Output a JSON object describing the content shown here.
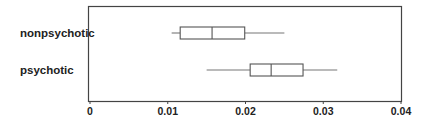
{
  "chart_data": {
    "type": "boxplot",
    "orientation": "horizontal",
    "title": "",
    "xlabel": "",
    "ylabel": "",
    "xlim": [
      0,
      0.04
    ],
    "x_ticks": [
      0,
      0.01,
      0.02,
      0.03,
      0.04
    ],
    "x_tick_labels": [
      "0",
      "0.01",
      "0.02",
      "0.03",
      "0.04"
    ],
    "grid": false,
    "legend": null,
    "categories": [
      "nonpsychotic",
      "psychotic"
    ],
    "series": [
      {
        "name": "nonpsychotic",
        "min": 0.0105,
        "q1": 0.0116,
        "median": 0.0157,
        "q3": 0.0199,
        "max": 0.025
      },
      {
        "name": "psychotic",
        "min": 0.015,
        "q1": 0.0206,
        "median": 0.0233,
        "q3": 0.0274,
        "max": 0.0318
      }
    ]
  },
  "colors": {
    "frame": "#444444",
    "box": "#555555",
    "whisker": "#777777",
    "text": "#222222"
  }
}
